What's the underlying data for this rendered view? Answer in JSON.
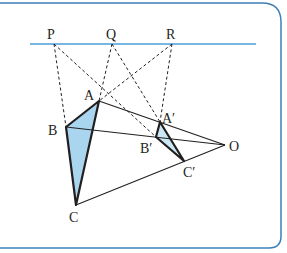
{
  "diagram": {
    "frame_color": "#3d7fb8",
    "line_color": "#4a9fd8",
    "fill_color": "#a9d6ee",
    "ink_color": "#231f20",
    "points": {
      "P": {
        "label": "P"
      },
      "Q": {
        "label": "Q"
      },
      "R": {
        "label": "R"
      },
      "A": {
        "label": "A"
      },
      "B": {
        "label": "B"
      },
      "C": {
        "label": "C"
      },
      "A1": {
        "label": "A′"
      },
      "B1": {
        "label": "B′"
      },
      "C1": {
        "label": "C′"
      },
      "O": {
        "label": "O"
      }
    }
  }
}
